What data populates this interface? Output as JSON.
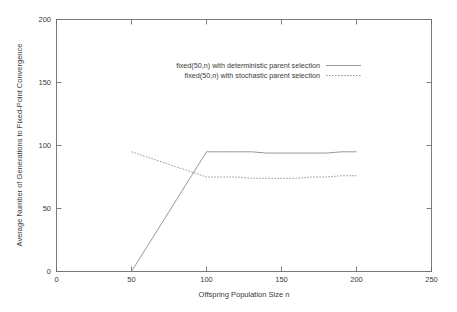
{
  "chart_data": {
    "type": "line",
    "title": "",
    "xlabel": "Offspring Population Size n",
    "ylabel": "Average Number of Generations to Fixed-Point Convergence",
    "xlim": [
      0,
      250
    ],
    "ylim": [
      0,
      200
    ],
    "xticks": [
      0,
      50,
      100,
      150,
      200,
      250
    ],
    "yticks": [
      0,
      50,
      100,
      150,
      200
    ],
    "grid": false,
    "legend_position": "upper-center",
    "series": [
      {
        "name": "fixed(50,n) with deterministic parent selection",
        "style": "solid",
        "color": "#8c8c8c",
        "x": [
          50,
          60,
          70,
          80,
          90,
          100,
          110,
          120,
          130,
          140,
          150,
          160,
          170,
          180,
          190,
          200
        ],
        "y": [
          0,
          19,
          38,
          57,
          76,
          95,
          95,
          95,
          95,
          94,
          94,
          94,
          94,
          94,
          95,
          95
        ]
      },
      {
        "name": "fixed(50,n) with stochastic parent selection",
        "style": "dashed",
        "color": "#8c8c8c",
        "x": [
          50,
          60,
          70,
          80,
          90,
          100,
          110,
          120,
          130,
          140,
          150,
          160,
          170,
          180,
          190,
          200
        ],
        "y": [
          95,
          91,
          87,
          83,
          79,
          75,
          75,
          75,
          74,
          74,
          74,
          74,
          75,
          75,
          76,
          76
        ]
      }
    ]
  },
  "axes": {
    "x_title": "Offspring Population Size n",
    "y_title": "Average Number of Generations to Fixed-Point Convergence",
    "x_tick_labels": [
      "0",
      "50",
      "100",
      "150",
      "200",
      "250"
    ],
    "y_tick_labels": [
      "0",
      "50",
      "100",
      "150",
      "200"
    ]
  },
  "legend": {
    "entries": [
      {
        "label": "fixed(50,n) with deterministic parent selection",
        "style": "solid"
      },
      {
        "label": "fixed(50,n) with stochastic parent selection",
        "style": "dashed"
      }
    ]
  },
  "colors": {
    "frame": "#6e6e6e",
    "series": "#8c8c8c",
    "text": "#3a3a3a",
    "background": "#ffffff"
  }
}
